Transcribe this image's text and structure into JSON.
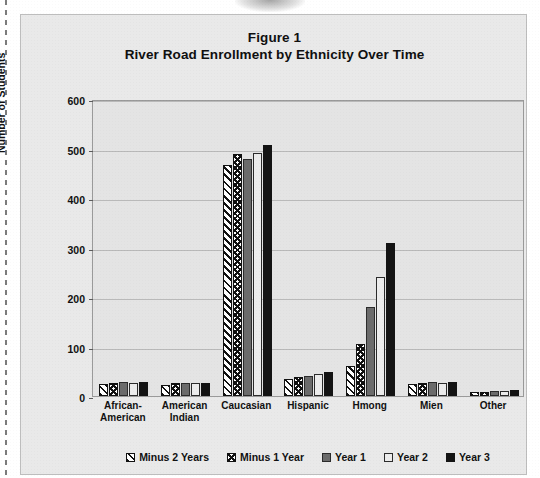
{
  "figure": {
    "title": "Figure 1",
    "subtitle": "River Road Enrollment by Ethnicity Over Time"
  },
  "chart_data": {
    "type": "bar",
    "title": "Figure 1",
    "subtitle": "River Road Enrollment by Ethnicity Over Time",
    "xlabel": "",
    "ylabel": "Number of Students",
    "ylim": [
      0,
      600
    ],
    "yticks": [
      0,
      100,
      200,
      300,
      400,
      500,
      600
    ],
    "grid": true,
    "legend_position": "bottom",
    "categories": [
      "African-American",
      "American Indian",
      "Caucasian",
      "Hispanic",
      "Hmong",
      "Mien",
      "Other"
    ],
    "category_lines": [
      [
        "African-",
        "American"
      ],
      [
        "American",
        "Indian"
      ],
      [
        "Caucasian",
        ""
      ],
      [
        "Hispanic",
        ""
      ],
      [
        "Hmong",
        ""
      ],
      [
        "Mien",
        ""
      ],
      [
        "Other",
        ""
      ]
    ],
    "series": [
      {
        "name": "Minus 2 Years",
        "pattern": "diagonal-hatch",
        "values": [
          25,
          22,
          467,
          35,
          60,
          25,
          8
        ]
      },
      {
        "name": "Minus 1 Year",
        "pattern": "checkered",
        "values": [
          27,
          26,
          488,
          38,
          105,
          27,
          9
        ]
      },
      {
        "name": "Year 1",
        "pattern": "solid-gray",
        "color": "#6b6b6b",
        "values": [
          28,
          27,
          478,
          41,
          180,
          28,
          10
        ]
      },
      {
        "name": "Year 2",
        "pattern": "light",
        "color": "#ececec",
        "values": [
          27,
          26,
          490,
          44,
          240,
          27,
          11
        ]
      },
      {
        "name": "Year 3",
        "pattern": "solid-black",
        "color": "#141414",
        "values": [
          29,
          27,
          507,
          48,
          310,
          28,
          12
        ]
      }
    ]
  }
}
